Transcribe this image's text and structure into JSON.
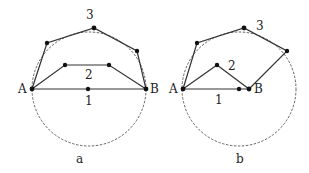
{
  "figures": [
    {
      "id": "a",
      "caption": "a",
      "circle": {
        "cx": 89,
        "cy": 89,
        "r": 57
      },
      "endpoints": {
        "A": {
          "label": "A",
          "x": 32,
          "y": 89
        },
        "B": {
          "label": "B",
          "x": 146,
          "y": 89
        }
      },
      "paths": [
        {
          "label": "1",
          "points": [
            [
              32,
              89
            ],
            [
              88,
              89
            ],
            [
              146,
              89
            ]
          ],
          "label_pos": [
            88,
            108
          ]
        },
        {
          "label": "2",
          "points": [
            [
              32,
              89
            ],
            [
              65,
              65
            ],
            [
              109,
              65
            ],
            [
              146,
              89
            ]
          ],
          "label_pos": [
            88,
            82
          ]
        },
        {
          "label": "3",
          "points": [
            [
              32,
              89
            ],
            [
              47,
              43
            ],
            [
              94,
              28
            ],
            [
              137,
              51
            ],
            [
              146,
              89
            ]
          ],
          "label_pos": [
            89,
            19
          ]
        }
      ]
    },
    {
      "id": "b",
      "caption": "b",
      "circle": {
        "cx": 239,
        "cy": 89,
        "r": 57
      },
      "endpoints": {
        "A": {
          "label": "A",
          "x": 183,
          "y": 89
        },
        "B": {
          "label": "B",
          "x": 249,
          "y": 89
        }
      },
      "paths": [
        {
          "label": "1",
          "points": [
            [
              183,
              89
            ],
            [
              239,
              89
            ],
            [
              249,
              89
            ]
          ],
          "label_pos": [
            219,
            107
          ]
        },
        {
          "label": "2",
          "points": [
            [
              183,
              89
            ],
            [
              217,
              65
            ],
            [
              249,
              89
            ]
          ],
          "label_pos": [
            232,
            70
          ]
        },
        {
          "label": "3",
          "points": [
            [
              183,
              89
            ],
            [
              197,
              43
            ],
            [
              244,
              28
            ],
            [
              287,
              51
            ],
            [
              249,
              89
            ]
          ],
          "label_pos": [
            260,
            30
          ]
        }
      ]
    }
  ]
}
